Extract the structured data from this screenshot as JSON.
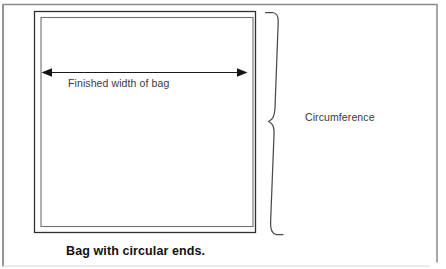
{
  "figure": {
    "caption": "Bag with circular ends.",
    "labels": {
      "finished_width": "Finished width of bag",
      "circumference": "Circumference"
    },
    "colors": {
      "page_border": "#808080",
      "bag_outline_outer": "#2b2b2b",
      "bag_outline_inner": "#6e6e6e",
      "dimension_arrow": "#1a1a1a",
      "brace": "#4a4a4a",
      "caption_text": "#111111",
      "label_text": "#3a3a3a",
      "background": "#ffffff"
    },
    "elements": {
      "page_frame": "page-border-frame",
      "bag_outer_rectangle": "bag-outer-rectangle",
      "bag_inner_rectangle": "bag-inner-rectangle",
      "width_dimension_arrow": "double-headed-horizontal-arrow",
      "circumference_brace": "right-curly-brace"
    }
  }
}
